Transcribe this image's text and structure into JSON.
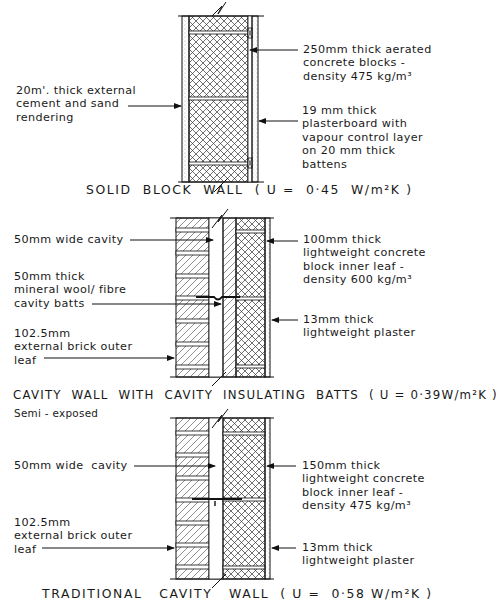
{
  "figure": {
    "sections": [
      {
        "id": "solid-block-wall",
        "caption": "SOLID  BLOCK  WALL  ( U =  0·45  W/m²K )",
        "labels_left": [
          {
            "text": "20m'. thick external\ncement and sand\nrendering"
          }
        ],
        "labels_right": [
          {
            "text": "250mm thick aerated\nconcrete blocks -\ndensity 475 kg/m³"
          },
          {
            "text": "19 mm thick\nplasterboard with\nvapour control layer\non 20 mm thick\nbattens"
          }
        ]
      },
      {
        "id": "cavity-wall-with-batts",
        "caption": "CAVITY  WALL  WITH  CAVITY  INSULATING  BATTS  ( U = 0·39W/m²K )",
        "labels_left": [
          {
            "text": "50mm wide cavity"
          },
          {
            "text": "50mm thick\nmineral wool/ fibre\ncavity batts"
          },
          {
            "text": "102.5mm\nexternal brick outer\nleaf"
          }
        ],
        "labels_right": [
          {
            "text": "100mm thick\nlightweight concrete\nblock inner leaf -\ndensity 600 kg/m³"
          },
          {
            "text": "13mm thick\nlightweight plaster"
          }
        ]
      },
      {
        "id": "traditional-cavity-wall",
        "note": "Semi - exposed",
        "caption": "TRADITIONAL   CAVITY   WALL  ( U =  0·58 W/m²K )",
        "labels_left": [
          {
            "text": "50mm wide  cavity"
          },
          {
            "text": "102.5mm\nexternal brick outer\nleaf"
          }
        ],
        "labels_right": [
          {
            "text": "150mm thick\nlightweight concrete\nblock inner leaf -\ndensity 475 kg/m³"
          },
          {
            "text": "13mm thick\nlightweight plaster"
          }
        ]
      }
    ]
  }
}
